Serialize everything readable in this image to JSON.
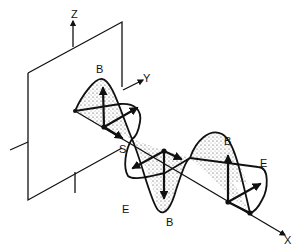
{
  "figure": {
    "labels": {
      "z_axis": "Z",
      "y_axis": "Y",
      "x_axis": "X",
      "source": "S",
      "b_field_1": "B",
      "b_field_2": "B",
      "b_field_3": "B",
      "e_field_1": "E",
      "e_field_2": "E"
    },
    "colors": {
      "ink": "#111111",
      "background": "#ffffff"
    }
  }
}
